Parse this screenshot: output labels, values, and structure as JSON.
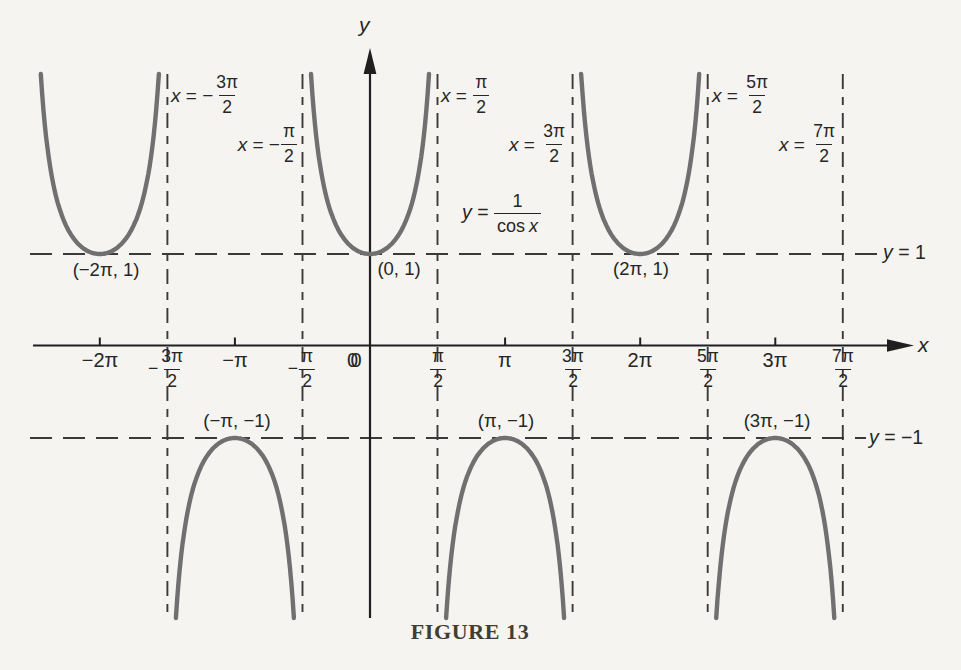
{
  "figure": {
    "caption": "FIGURE 13",
    "axis": {
      "x_label": "x",
      "y_label": "y",
      "origin_label": "0"
    },
    "function_label": {
      "var": "y",
      "rel": " = ",
      "numerator": "1",
      "den_fn": "cos",
      "den_var": "x"
    },
    "guide_labels": [
      {
        "var": "y",
        "rest": " = 1"
      },
      {
        "var": "y",
        "rest": " = −1"
      }
    ]
  },
  "chart_data": {
    "type": "line",
    "title": "FIGURE 13",
    "function": "y = 1/cos x (secant curve)",
    "xlabel": "x",
    "ylabel": "y",
    "xlim_pi": [
      -2.8,
      4.2
    ],
    "ylim": [
      -3,
      3
    ],
    "grid": false,
    "horizontal_guides": [
      {
        "y": 1,
        "label": "y = 1"
      },
      {
        "y": -1,
        "label": "y = −1"
      }
    ],
    "vertical_asymptotes_pi": [
      -1.5,
      -0.5,
      0.5,
      1.5,
      2.5,
      3.5
    ],
    "asymptote_labels": [
      {
        "var": "x",
        "rel": " = −",
        "num": "3π",
        "den": "2"
      },
      {
        "var": "x",
        "rel": " = −",
        "num": "π",
        "den": "2"
      },
      {
        "var": "x",
        "rel": " = ",
        "num": "π",
        "den": "2"
      },
      {
        "var": "x",
        "rel": " = ",
        "num": "3π",
        "den": "2"
      },
      {
        "var": "x",
        "rel": " = ",
        "num": "5π",
        "den": "2"
      },
      {
        "var": "x",
        "rel": " = ",
        "num": "7π",
        "den": "2"
      }
    ],
    "branch_centers_pi": {
      "minima": [
        -2,
        0,
        2
      ],
      "maxima": [
        -1,
        1,
        3
      ]
    },
    "key_points": [
      {
        "label": "(−2π, 1)",
        "x_pi": -2,
        "y": 1
      },
      {
        "label": "(0, 1)",
        "x_pi": 0,
        "y": 1
      },
      {
        "label": "(2π, 1)",
        "x_pi": 2,
        "y": 1
      },
      {
        "label": "(−π, −1)",
        "x_pi": -1,
        "y": -1
      },
      {
        "label": "(π, −1)",
        "x_pi": 1,
        "y": -1
      },
      {
        "label": "(3π, −1)",
        "x_pi": 3,
        "y": -1
      }
    ],
    "x_ticks": [
      {
        "pi": -2,
        "type": "plain",
        "text": "−2π"
      },
      {
        "pi": -1.5,
        "type": "frac",
        "sign": "−",
        "num": "3π",
        "den": "2"
      },
      {
        "pi": -1,
        "type": "plain",
        "text": "−π"
      },
      {
        "pi": -0.5,
        "type": "frac",
        "sign": "−",
        "num": "π",
        "den": "2"
      },
      {
        "pi": 0,
        "type": "plain",
        "text": "0"
      },
      {
        "pi": 0.5,
        "type": "frac",
        "sign": "",
        "num": "π",
        "den": "2"
      },
      {
        "pi": 1,
        "type": "plain",
        "text": "π"
      },
      {
        "pi": 1.5,
        "type": "frac",
        "sign": "",
        "num": "3π",
        "den": "2"
      },
      {
        "pi": 2,
        "type": "plain",
        "text": "2π"
      },
      {
        "pi": 2.5,
        "type": "frac",
        "sign": "",
        "num": "5π",
        "den": "2"
      },
      {
        "pi": 3,
        "type": "plain",
        "text": "3π"
      },
      {
        "pi": 3.5,
        "type": "frac",
        "sign": "",
        "num": "7π",
        "den": "2"
      }
    ],
    "colors": {
      "curve": "#707070",
      "axis": "#1f1f1f",
      "dash": "#3a3a3a",
      "text": "#262626",
      "background": "#f5f4f0",
      "caption": "#3e3e33"
    }
  }
}
